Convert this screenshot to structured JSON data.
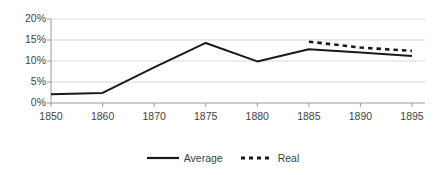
{
  "chart_data": {
    "type": "line",
    "title": "",
    "subtitle": "",
    "xlabel": "",
    "ylabel": "",
    "categories": [
      "1850",
      "1860",
      "1870",
      "1875",
      "1880",
      "1885",
      "1890",
      "1895"
    ],
    "ylim": [
      0,
      20
    ],
    "yticks": [
      0,
      5,
      10,
      15,
      20
    ],
    "ytick_labels": [
      "0%",
      "5%",
      "10%",
      "15%",
      "20%"
    ],
    "xtick_labels": [
      "1850",
      "1860",
      "1870",
      "1875",
      "1880",
      "1885",
      "1890",
      "1895"
    ],
    "grid": true,
    "grid_axis": "y",
    "legend_position": "bottom",
    "series": [
      {
        "name": "Average",
        "style": "solid",
        "color": "#1a1a1a",
        "values": [
          2.1,
          2.4,
          8.5,
          14.3,
          9.9,
          12.8,
          12.0,
          11.2
        ]
      },
      {
        "name": "Real",
        "style": "dashed",
        "color": "#1a1a1a",
        "values": [
          null,
          null,
          null,
          null,
          null,
          14.6,
          13.2,
          12.4
        ]
      }
    ],
    "axis_color": "#9a9a9a",
    "grid_color": "#d9d9d9",
    "text_color": "#3f3f3f",
    "background": "#ffffff"
  },
  "legend": {
    "entries": [
      {
        "label": "Average",
        "icon": "solid-line-swatch"
      },
      {
        "label": "Real",
        "icon": "dashed-line-swatch"
      }
    ]
  }
}
